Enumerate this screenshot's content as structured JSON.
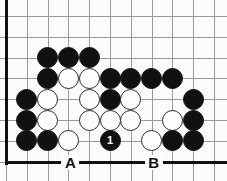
{
  "diagram": {
    "type": "go-board-problem",
    "board": {
      "origin_x": 6,
      "origin_y": 16,
      "spacing": 20.8,
      "cols": 11,
      "rows": 8,
      "left_edge": true,
      "bottom_edge": true,
      "grid_color": "#9a9a9a",
      "edge_color": "#111111",
      "background": "#fbfbf9"
    },
    "star_points": [
      {
        "col": 2,
        "row": 4
      }
    ],
    "stones": [
      {
        "col": 2,
        "row": 2,
        "color": "black"
      },
      {
        "col": 3,
        "row": 2,
        "color": "black"
      },
      {
        "col": 4,
        "row": 2,
        "color": "black"
      },
      {
        "col": 2,
        "row": 3,
        "color": "black"
      },
      {
        "col": 3,
        "row": 3,
        "color": "white"
      },
      {
        "col": 4,
        "row": 3,
        "color": "white"
      },
      {
        "col": 5,
        "row": 3,
        "color": "black"
      },
      {
        "col": 6,
        "row": 3,
        "color": "black"
      },
      {
        "col": 7,
        "row": 3,
        "color": "black"
      },
      {
        "col": 8,
        "row": 3,
        "color": "black"
      },
      {
        "col": 1,
        "row": 4,
        "color": "black"
      },
      {
        "col": 2,
        "row": 4,
        "color": "white"
      },
      {
        "col": 4,
        "row": 4,
        "color": "white"
      },
      {
        "col": 5,
        "row": 4,
        "color": "black"
      },
      {
        "col": 6,
        "row": 4,
        "color": "white"
      },
      {
        "col": 9,
        "row": 4,
        "color": "black"
      },
      {
        "col": 1,
        "row": 5,
        "color": "black"
      },
      {
        "col": 2,
        "row": 5,
        "color": "white"
      },
      {
        "col": 4,
        "row": 5,
        "color": "white"
      },
      {
        "col": 5,
        "row": 5,
        "color": "white"
      },
      {
        "col": 6,
        "row": 5,
        "color": "white"
      },
      {
        "col": 8,
        "row": 5,
        "color": "white"
      },
      {
        "col": 9,
        "row": 5,
        "color": "black"
      },
      {
        "col": 1,
        "row": 6,
        "color": "black"
      },
      {
        "col": 2,
        "row": 6,
        "color": "black"
      },
      {
        "col": 3,
        "row": 6,
        "color": "white"
      },
      {
        "col": 5,
        "row": 6,
        "color": "black",
        "number": "1"
      },
      {
        "col": 7,
        "row": 6,
        "color": "white"
      },
      {
        "col": 8,
        "row": 6,
        "color": "black"
      },
      {
        "col": 9,
        "row": 6,
        "color": "black"
      }
    ],
    "edge_labels": [
      {
        "text": "A",
        "col": 3,
        "row": 7
      },
      {
        "text": "B",
        "col": 7,
        "row": 7
      }
    ],
    "move_number_label": "1"
  }
}
